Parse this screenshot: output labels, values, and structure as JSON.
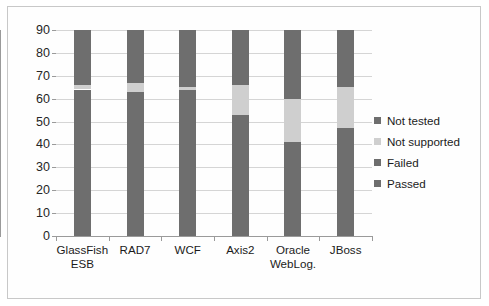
{
  "chart_data": {
    "type": "bar",
    "subtype": "stacked-bar",
    "title": "",
    "subtitle": "",
    "xlabel": "",
    "ylabel": "",
    "ylim": [
      0,
      90
    ],
    "ytick_step": 10,
    "yticks": [
      0,
      10,
      20,
      30,
      40,
      50,
      60,
      70,
      80,
      90
    ],
    "ytick_labels": [
      "0",
      "10",
      "20",
      "30",
      "40",
      "50",
      "60",
      "70",
      "80",
      "90"
    ],
    "grid": true,
    "grid_axis": "y",
    "legend_position": "right",
    "categories": [
      "GlassFish ESB",
      "RAD7",
      "WCF",
      "Axis2",
      "Oracle WebLog.",
      "JBoss"
    ],
    "category_lines": [
      [
        "GlassFish",
        "ESB"
      ],
      [
        "RAD7"
      ],
      [
        "WCF"
      ],
      [
        "Axis2"
      ],
      [
        "Oracle",
        "WebLog."
      ],
      [
        "JBoss"
      ]
    ],
    "series": [
      {
        "name": "Passed",
        "color": "#6e6e6e",
        "values": [
          64,
          63,
          64,
          53,
          41,
          47
        ]
      },
      {
        "name": "Failed",
        "color": "#6e6e6e",
        "values": [
          0,
          0,
          0,
          0,
          0,
          0
        ]
      },
      {
        "name": "Not supported",
        "color": "#cfcfcf",
        "values": [
          2,
          4,
          1,
          13,
          19,
          18
        ]
      },
      {
        "name": "Not tested",
        "color": "#6e6e6e",
        "values": [
          24,
          23,
          25,
          24,
          30,
          25
        ]
      }
    ],
    "stack_order_bottom_to_top": [
      "Passed",
      "Failed",
      "Not supported",
      "Not tested"
    ],
    "stack_totals": [
      90,
      90,
      90,
      90,
      90,
      90
    ],
    "legend_entries": [
      {
        "label": "Not tested",
        "color": "#6e6e6e"
      },
      {
        "label": "Not supported",
        "color": "#cfcfcf"
      },
      {
        "label": "Failed",
        "color": "#6e6e6e"
      },
      {
        "label": "Passed",
        "color": "#6e6e6e"
      }
    ]
  }
}
